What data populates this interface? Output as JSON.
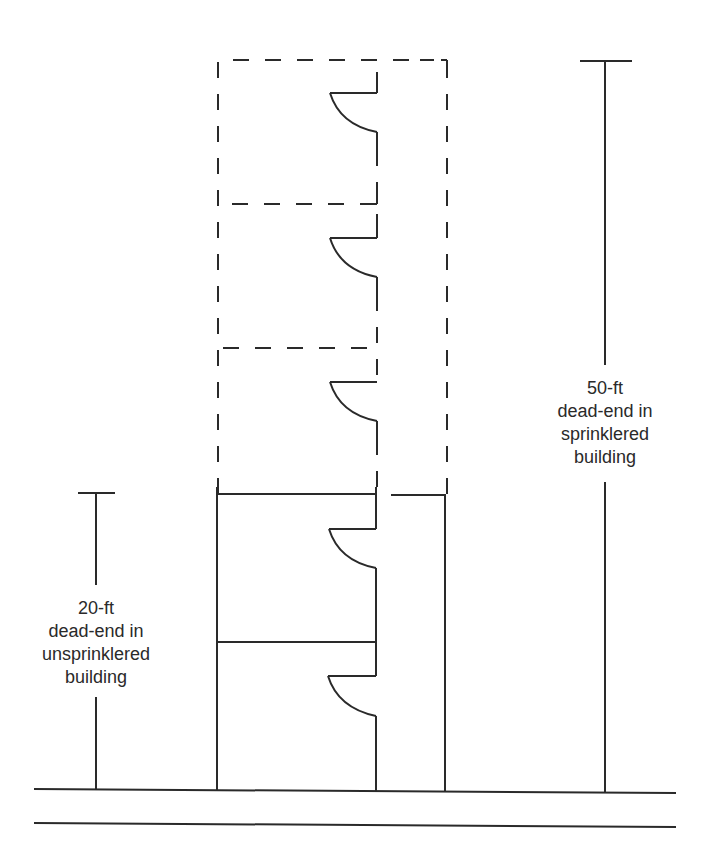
{
  "diagram": {
    "type": "floor-plan",
    "stroke_color": "#2a2a2a",
    "background": "#ffffff",
    "rooms_solid": 2,
    "rooms_dashed": 3,
    "doors": 5
  },
  "labels": {
    "left": {
      "lines": [
        "20-ft",
        "dead-end in",
        "unsprinklered",
        "building"
      ]
    },
    "right": {
      "lines": [
        "50-ft",
        "dead-end in",
        "sprinklered",
        "building"
      ]
    }
  }
}
